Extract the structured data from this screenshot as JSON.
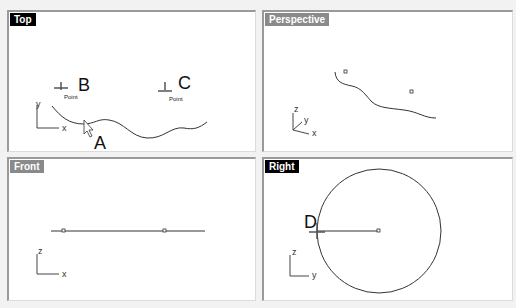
{
  "viewports": {
    "top": {
      "title": "Top",
      "active": true,
      "axes": {
        "v": "y",
        "h": "x"
      },
      "points": [
        {
          "label": "B",
          "tag": "Point"
        },
        {
          "label": "C",
          "tag": "Point"
        }
      ],
      "cursor_label": "A"
    },
    "perspective": {
      "title": "Perspective",
      "active": false,
      "axes": {
        "v": "z",
        "d": "y",
        "h": "x"
      }
    },
    "front": {
      "title": "Front",
      "active": false,
      "axes": {
        "v": "z",
        "h": "x"
      }
    },
    "right": {
      "title": "Right",
      "active": true,
      "axes": {
        "v": "z",
        "h": "y"
      },
      "point_label": "D"
    }
  }
}
